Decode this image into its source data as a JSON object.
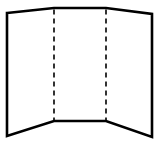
{
  "diagram": {
    "colors": {
      "stroke": "#000000",
      "background": "#ffffff"
    },
    "outline_points": "7,13 54,8 106,8 152,14 152,137 106,121 54,121 7,136",
    "fold_lines": [
      {
        "x1": 54,
        "y1": 8,
        "x2": 54,
        "y2": 121
      },
      {
        "x1": 106,
        "y1": 8,
        "x2": 106,
        "y2": 121
      }
    ]
  }
}
